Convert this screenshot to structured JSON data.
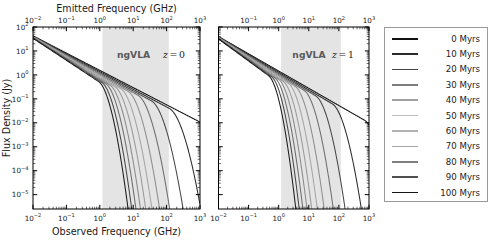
{
  "figure": {
    "width": 492,
    "height": 242,
    "background": "#ffffff"
  },
  "chart_data": {
    "type": "line",
    "title": "",
    "subtitle": "",
    "panels": [
      {
        "id": "left",
        "annotation": "z = 0",
        "redshift": 0,
        "band_label": "ngVLA",
        "band_range_ghz": [
          1.2,
          116
        ],
        "band_color": "#e4e4e4",
        "top_axis": {
          "label": "Emitted Frequency (GHz)",
          "ticks": [
            -2,
            -1,
            0,
            1,
            2,
            3
          ],
          "tick_labels": [
            "10-2",
            "10-1",
            "100",
            "101",
            "102",
            "103"
          ],
          "xlim": [
            -2,
            3
          ]
        },
        "bottom_axis": {
          "label": "Observed Frequency (GHz)",
          "ticks": [
            -2,
            -1,
            0,
            1,
            2,
            3
          ],
          "tick_labels": [
            "10-2",
            "10-1",
            "100",
            "101",
            "102",
            "103"
          ],
          "xlim": [
            -2,
            3
          ]
        },
        "y_axis": {
          "label": "Flux Density (Jy)",
          "ticks": [
            2,
            1,
            0,
            -1,
            -2,
            -3,
            -4,
            -5
          ],
          "tick_labels": [
            "102",
            "101",
            "100",
            "10-1",
            "10-2",
            "10-3",
            "10-4",
            "10-5"
          ],
          "ylim": [
            -5.6,
            2.0
          ]
        },
        "grid": false,
        "series": [
          {
            "name": "0 Myrs",
            "age": 0,
            "color": "#111111",
            "nu_break": 1400.0,
            "y0": 1.63,
            "alpha": 0.72,
            "steep": 4.0
          },
          {
            "name": "10 Myrs",
            "age": 10,
            "color": "#2b2b2b",
            "nu_break": 120.0,
            "y0": 1.62,
            "alpha": 0.74,
            "steep": 4.3
          },
          {
            "name": "20 Myrs",
            "age": 20,
            "color": "#474747",
            "nu_break": 35.0,
            "y0": 1.61,
            "alpha": 0.76,
            "steep": 4.6
          },
          {
            "name": "30 Myrs",
            "age": 30,
            "color": "#6d6d6d",
            "nu_break": 14.0,
            "y0": 1.6,
            "alpha": 0.78,
            "steep": 4.9
          },
          {
            "name": "40 Myrs",
            "age": 40,
            "color": "#8d8d8d",
            "nu_break": 7.0,
            "y0": 1.59,
            "alpha": 0.8,
            "steep": 5.1
          },
          {
            "name": "50 Myrs",
            "age": 50,
            "color": "#a5a5a5",
            "nu_break": 4.2,
            "y0": 1.58,
            "alpha": 0.82,
            "steep": 5.3
          },
          {
            "name": "60 Myrs",
            "age": 60,
            "color": "#9a9a9a",
            "nu_break": 2.8,
            "y0": 1.57,
            "alpha": 0.84,
            "steep": 5.5
          },
          {
            "name": "70 Myrs",
            "age": 70,
            "color": "#8a8a8a",
            "nu_break": 2.0,
            "y0": 1.56,
            "alpha": 0.86,
            "steep": 5.7
          },
          {
            "name": "80 Myrs",
            "age": 80,
            "color": "#6e6e6e",
            "nu_break": 1.5,
            "y0": 1.55,
            "alpha": 0.88,
            "steep": 5.9
          },
          {
            "name": "90 Myrs",
            "age": 90,
            "color": "#474747",
            "nu_break": 1.15,
            "y0": 1.54,
            "alpha": 0.9,
            "steep": 6.1
          },
          {
            "name": "100 Myrs",
            "age": 100,
            "color": "#1c1c1c",
            "nu_break": 0.92,
            "y0": 1.53,
            "alpha": 0.92,
            "steep": 6.3
          }
        ]
      },
      {
        "id": "right",
        "annotation": "z = 1",
        "redshift": 1,
        "band_label": "ngVLA",
        "band_range_ghz": [
          1.2,
          116
        ],
        "band_color": "#e4e4e4",
        "top_axis": {
          "label": "",
          "ticks": [
            -1,
            0,
            1,
            2,
            3
          ],
          "tick_labels": [
            "10-1",
            "100",
            "101",
            "102",
            "103"
          ],
          "xlim": [
            -2,
            3
          ]
        },
        "bottom_axis": {
          "label": "",
          "ticks": [
            -2,
            -1,
            0,
            1,
            2,
            3
          ],
          "tick_labels": [
            "10-2",
            "10-1",
            "100",
            "101",
            "102",
            "103"
          ],
          "xlim": [
            -2,
            3
          ]
        },
        "y_axis": {
          "label": "",
          "ticks": [
            2,
            1,
            0,
            -1,
            -2,
            -3,
            -4,
            -5
          ],
          "tick_labels": [
            "",
            "",
            "",
            "",
            "",
            "",
            "",
            ""
          ],
          "ylim": [
            -5.6,
            2.0
          ]
        },
        "grid": false,
        "series": [
          {
            "name": "0 Myrs",
            "age": 0,
            "color": "#111111",
            "nu_break": 700.0,
            "y0": 1.6,
            "alpha": 0.72,
            "steep": 4.0
          },
          {
            "name": "10 Myrs",
            "age": 10,
            "color": "#2b2b2b",
            "nu_break": 60.0,
            "y0": 1.59,
            "alpha": 0.74,
            "steep": 4.3
          },
          {
            "name": "20 Myrs",
            "age": 20,
            "color": "#474747",
            "nu_break": 17.0,
            "y0": 1.58,
            "alpha": 0.76,
            "steep": 4.6
          },
          {
            "name": "30 Myrs",
            "age": 30,
            "color": "#6d6d6d",
            "nu_break": 7.0,
            "y0": 1.57,
            "alpha": 0.78,
            "steep": 4.9
          },
          {
            "name": "40 Myrs",
            "age": 40,
            "color": "#8d8d8d",
            "nu_break": 3.5,
            "y0": 1.56,
            "alpha": 0.8,
            "steep": 5.1
          },
          {
            "name": "50 Myrs",
            "age": 50,
            "color": "#a5a5a5",
            "nu_break": 2.1,
            "y0": 1.55,
            "alpha": 0.82,
            "steep": 5.3
          },
          {
            "name": "60 Myrs",
            "age": 60,
            "color": "#9a9a9a",
            "nu_break": 1.4,
            "y0": 1.54,
            "alpha": 0.84,
            "steep": 5.5
          },
          {
            "name": "70 Myrs",
            "age": 70,
            "color": "#8a8a8a",
            "nu_break": 1.0,
            "y0": 1.53,
            "alpha": 0.86,
            "steep": 5.7
          },
          {
            "name": "80 Myrs",
            "age": 80,
            "color": "#6e6e6e",
            "nu_break": 0.75,
            "y0": 1.52,
            "alpha": 0.88,
            "steep": 5.9
          },
          {
            "name": "90 Myrs",
            "age": 90,
            "color": "#474747",
            "nu_break": 0.58,
            "y0": 1.51,
            "alpha": 0.9,
            "steep": 6.1
          },
          {
            "name": "100 Myrs",
            "age": 100,
            "color": "#1c1c1c",
            "nu_break": 0.46,
            "y0": 1.5,
            "alpha": 0.92,
            "steep": 6.3
          }
        ]
      }
    ],
    "legend": {
      "position": "right",
      "entries": [
        {
          "label": "0 Myrs",
          "color": "#111111"
        },
        {
          "label": "10 Myrs",
          "color": "#2b2b2b"
        },
        {
          "label": "20 Myrs",
          "color": "#474747"
        },
        {
          "label": "30 Myrs",
          "color": "#7d7d7d"
        },
        {
          "label": "40 Myrs",
          "color": "#a0a0a0"
        },
        {
          "label": "50 Myrs",
          "color": "#bdbdbd"
        },
        {
          "label": "60 Myrs",
          "color": "#b2b2b2"
        },
        {
          "label": "70 Myrs",
          "color": "#a6a6a6"
        },
        {
          "label": "80 Myrs",
          "color": "#808080"
        },
        {
          "label": "90 Myrs",
          "color": "#4f4f4f"
        },
        {
          "label": "100 Myrs",
          "color": "#141414"
        }
      ]
    }
  }
}
